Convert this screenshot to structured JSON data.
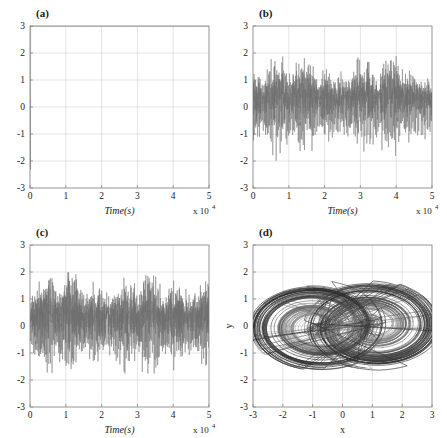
{
  "figure": {
    "background": "#ffffff",
    "trace_color": "#6e6e6e",
    "frame_color": "#8a8a8a",
    "grid_color": "#c9c9c9",
    "text_color": "#1a1a1a"
  },
  "chart_data": [
    {
      "type": "line",
      "panel_label": "(a)",
      "title": "",
      "xlabel": "Time(s)",
      "ylabel": "",
      "x_exponent_label": "x 10",
      "x_exponent_power": "4",
      "xlim": [
        0,
        5
      ],
      "ylim": [
        -3,
        3
      ],
      "xticks": [
        0,
        1,
        2,
        3,
        4,
        5
      ],
      "xticklabels": [
        "0",
        "1",
        "2",
        "3",
        "4",
        "5"
      ],
      "yticks": [
        -3,
        -2,
        -1,
        0,
        1,
        2,
        3
      ],
      "yticklabels": [
        "-3",
        "-2",
        "-1",
        "0",
        "1",
        "2",
        "3"
      ],
      "grid": true,
      "series_name": "x(t)",
      "signal": {
        "kind": "chaotic-oscillation",
        "samples": 1400,
        "seed": 17,
        "mean_level": -0.35,
        "envelope_high": 2.5,
        "envelope_low": -2.45,
        "burst_rate": 0.33,
        "fine_noise": 0.3,
        "description": "Asymmetric chaotic time series oscillating mostly between -2.4 and 2.5 with dense band near -1 to 0"
      }
    },
    {
      "type": "line",
      "panel_label": "(b)",
      "title": "",
      "xlabel": "Time(s)",
      "ylabel": "",
      "x_exponent_label": "x 10",
      "x_exponent_power": "4",
      "xlim": [
        0,
        5
      ],
      "ylim": [
        -3,
        3
      ],
      "xticks": [
        0,
        1,
        2,
        3,
        4,
        5
      ],
      "xticklabels": [
        "0",
        "1",
        "2",
        "3",
        "4",
        "5"
      ],
      "yticks": [
        -3,
        -2,
        -1,
        0,
        1,
        2,
        3
      ],
      "yticklabels": [
        "-3",
        "-2",
        "-1",
        "0",
        "1",
        "2",
        "3"
      ],
      "grid": true,
      "series_name": "y(t)",
      "signal": {
        "kind": "chaotic-oscillation",
        "samples": 1500,
        "seed": 43,
        "mean_level": 0.0,
        "envelope_high": 2.15,
        "envelope_low": -2.15,
        "burst_rate": 0.42,
        "fine_noise": 0.4,
        "description": "Zero-centred chaotic time series, dense core within -1 to 1 with spikes reaching about 2.1"
      }
    },
    {
      "type": "line",
      "panel_label": "(c)",
      "title": "",
      "xlabel": "Time(s)",
      "ylabel": "",
      "x_exponent_label": "x 10",
      "x_exponent_power": "4",
      "xlim": [
        0,
        5
      ],
      "ylim": [
        -3,
        3
      ],
      "xticks": [
        0,
        1,
        2,
        3,
        4,
        5
      ],
      "xticklabels": [
        "0",
        "1",
        "2",
        "3",
        "4",
        "5"
      ],
      "yticks": [
        -3,
        -2,
        -1,
        0,
        1,
        2,
        3
      ],
      "yticklabels": [
        "-3",
        "-2",
        "-1",
        "0",
        "1",
        "2",
        "3"
      ],
      "grid": true,
      "series_name": "z(t)",
      "signal": {
        "kind": "chaotic-oscillation",
        "samples": 1600,
        "seed": 91,
        "mean_level": 0.0,
        "envelope_high": 2.0,
        "envelope_low": -2.0,
        "burst_rate": 0.5,
        "fine_noise": 0.46,
        "description": "Zero-centred chaotic time series similar to (b), slightly denser with spikes near 2.0"
      }
    },
    {
      "type": "line",
      "panel_label": "(d)",
      "title": "",
      "xlabel": "x",
      "ylabel": "y",
      "xlim": [
        -3,
        3
      ],
      "ylim": [
        -3,
        3
      ],
      "xticks": [
        -3,
        -2,
        -1,
        0,
        1,
        2,
        3
      ],
      "xticklabels": [
        "-3",
        "-2",
        "-1",
        "0",
        "1",
        "2",
        "3"
      ],
      "yticks": [
        -3,
        -2,
        -1,
        0,
        1,
        2,
        3
      ],
      "yticklabels": [
        "-3",
        "-2",
        "-1",
        "0",
        "1",
        "2",
        "3"
      ],
      "grid": true,
      "series_name": "phase portrait y vs x",
      "attractor": {
        "kind": "double-scroll",
        "revolutions": 150,
        "points_per_rev": 60,
        "left_center": [
          -0.85,
          0.0
        ],
        "right_center": [
          1.0,
          0.0
        ],
        "x_extent": [
          -2.4,
          2.3
        ],
        "y_extent": [
          -2.2,
          2.2
        ],
        "description": "Two-lobe double-scroll chaotic attractor; trajectories spiral outward from each focus and switch lobes at the outer band"
      }
    }
  ]
}
